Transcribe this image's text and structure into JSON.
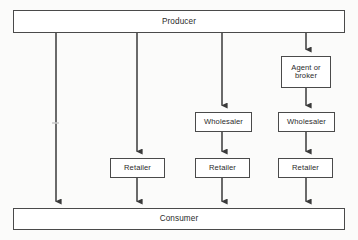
{
  "diagram": {
    "stroke_color": "#4a4a4a",
    "text_color": "#2b2b2b",
    "background_color": "#fbfbfa",
    "node_fill": "#ffffff",
    "nodes": {
      "producer": {
        "label": "Producer"
      },
      "consumer": {
        "label": "Consumer"
      },
      "agent_or_broker": {
        "label": "Agent or\nbroker"
      },
      "wholesaler_a": {
        "label": "Wholesaler"
      },
      "wholesaler_b": {
        "label": "Wholesaler"
      },
      "retailer_a": {
        "label": "Retailer"
      },
      "retailer_b": {
        "label": "Retailer"
      },
      "retailer_c": {
        "label": "Retailer"
      }
    },
    "channels": [
      {
        "name": "direct",
        "column_x": 56,
        "path": [
          "Producer",
          "Consumer"
        ]
      },
      {
        "name": "retail",
        "column_x": 137,
        "path": [
          "Producer",
          "Retailer",
          "Consumer"
        ]
      },
      {
        "name": "wholesale-retail",
        "column_x": 222,
        "path": [
          "Producer",
          "Wholesaler",
          "Retailer",
          "Consumer"
        ]
      },
      {
        "name": "agent-wholesale-retail",
        "column_x": 306,
        "path": [
          "Producer",
          "Agent or broker",
          "Wholesaler",
          "Retailer",
          "Consumer"
        ]
      }
    ],
    "arrow_count": 11,
    "arrow_direction": "down"
  }
}
